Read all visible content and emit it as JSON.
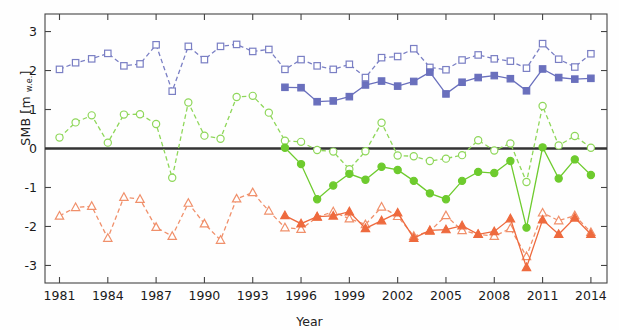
{
  "chart_data": {
    "type": "line",
    "title": "",
    "xlabel": "Year",
    "ylabel": "SMB [m w.e.]",
    "ylabel_base": "SMB [m ",
    "ylabel_sub": "w.e.",
    "ylabel_tail": "]",
    "xlim": [
      1980.1,
      2015.0
    ],
    "ylim": [
      -3.45,
      3.45
    ],
    "xticks": [
      1981,
      1984,
      1987,
      1990,
      1993,
      1996,
      1999,
      2002,
      2005,
      2008,
      2011,
      2014
    ],
    "xticklabels": [
      "1981",
      "1984",
      "1987",
      "1990",
      "1993",
      "1996",
      "1999",
      "2002",
      "2005",
      "2008",
      "2011",
      "2014"
    ],
    "yticks": [
      -3,
      -2,
      -1,
      0,
      1,
      2,
      3
    ],
    "yticklabels": [
      "-3",
      "-2",
      "-1",
      "0",
      "1",
      "2",
      "3"
    ],
    "grid": false,
    "zero_line": true,
    "zero_line_color": "#333333",
    "colors": {
      "blue": "#7a7fc4",
      "green": "#7ed84a",
      "orange": "#ef7a52",
      "axis": "#444444",
      "zero": "#333333"
    },
    "series": [
      {
        "name": "blue-open-dashed",
        "color": "#7a7fc4",
        "marker": "square",
        "fill": "open",
        "linestyle": "dashed",
        "x": [
          1981,
          1982,
          1983,
          1984,
          1985,
          1986,
          1987,
          1988,
          1989,
          1990,
          1991,
          1992,
          1993,
          1994,
          1995,
          1996,
          1997,
          1998,
          1999,
          2000,
          2001,
          2002,
          2003,
          2004,
          2005,
          2006,
          2007,
          2008,
          2009,
          2010,
          2011,
          2012,
          2013,
          2014
        ],
        "values": [
          2.03,
          2.2,
          2.3,
          2.44,
          2.12,
          2.17,
          2.66,
          1.47,
          2.62,
          2.28,
          2.62,
          2.67,
          2.49,
          2.54,
          2.03,
          2.28,
          2.12,
          2.03,
          2.16,
          1.82,
          2.33,
          2.36,
          2.56,
          2.08,
          2.02,
          2.27,
          2.4,
          2.3,
          2.24,
          2.06,
          2.69,
          2.29,
          2.09,
          2.43
        ]
      },
      {
        "name": "blue-filled-solid",
        "color": "#6a70bd",
        "marker": "square",
        "fill": "filled",
        "linestyle": "solid",
        "x": [
          1995,
          1996,
          1997,
          1998,
          1999,
          2000,
          2001,
          2002,
          2003,
          2004,
          2005,
          2006,
          2007,
          2008,
          2009,
          2010,
          2011,
          2012,
          2013,
          2014
        ],
        "values": [
          1.57,
          1.56,
          1.2,
          1.22,
          1.33,
          1.63,
          1.73,
          1.6,
          1.72,
          1.96,
          1.4,
          1.7,
          1.82,
          1.87,
          1.79,
          1.48,
          2.04,
          1.82,
          1.78,
          1.8
        ]
      },
      {
        "name": "green-open-dashed",
        "color": "#8fd75a",
        "marker": "circle",
        "fill": "open",
        "linestyle": "dashed",
        "x": [
          1981,
          1982,
          1983,
          1984,
          1985,
          1986,
          1987,
          1988,
          1989,
          1990,
          1991,
          1992,
          1993,
          1994,
          1995,
          1996,
          1997,
          1998,
          1999,
          2000,
          2001,
          2002,
          2003,
          2004,
          2005,
          2006,
          2007,
          2008,
          2009,
          2010,
          2011,
          2012,
          2013,
          2014
        ],
        "values": [
          0.28,
          0.67,
          0.85,
          0.15,
          0.87,
          0.88,
          0.63,
          -0.75,
          1.18,
          0.33,
          0.25,
          1.32,
          1.35,
          0.92,
          0.2,
          0.17,
          -0.04,
          -0.08,
          -0.53,
          -0.07,
          0.66,
          -0.18,
          -0.2,
          -0.32,
          -0.26,
          -0.17,
          0.21,
          -0.05,
          0.13,
          -0.86,
          1.09,
          0.08,
          0.32,
          0.02
        ]
      },
      {
        "name": "green-filled-solid",
        "color": "#6ecb2e",
        "marker": "circle",
        "fill": "filled",
        "linestyle": "solid",
        "x": [
          1995,
          1996,
          1997,
          1998,
          1999,
          2000,
          2001,
          2002,
          2003,
          2004,
          2005,
          2006,
          2007,
          2008,
          2009,
          2010,
          2011,
          2012,
          2013,
          2014
        ],
        "values": [
          0.02,
          -0.4,
          -1.3,
          -0.95,
          -0.65,
          -0.8,
          -0.47,
          -0.55,
          -0.83,
          -1.15,
          -1.3,
          -0.83,
          -0.6,
          -0.63,
          -0.32,
          -2.03,
          0.03,
          -0.77,
          -0.28,
          -0.68
        ]
      },
      {
        "name": "orange-open-dashed",
        "color": "#f0906b",
        "marker": "triangle",
        "fill": "open",
        "linestyle": "dashed",
        "x": [
          1981,
          1982,
          1983,
          1984,
          1985,
          1986,
          1987,
          1988,
          1989,
          1990,
          1991,
          1992,
          1993,
          1994,
          1995,
          1996,
          1997,
          1998,
          1999,
          2000,
          2001,
          2002,
          2003,
          2004,
          2005,
          2006,
          2007,
          2008,
          2009,
          2010,
          2011,
          2012,
          2013,
          2014
        ],
        "values": [
          -1.73,
          -1.51,
          -1.48,
          -2.3,
          -1.25,
          -1.3,
          -2.02,
          -2.25,
          -1.4,
          -1.93,
          -2.35,
          -1.29,
          -1.13,
          -1.6,
          -2.03,
          -2.07,
          -1.76,
          -1.62,
          -1.8,
          -1.95,
          -1.5,
          -1.74,
          -2.25,
          -2.12,
          -1.72,
          -2.1,
          -2.2,
          -2.25,
          -2.05,
          -2.77,
          -1.65,
          -1.85,
          -1.72,
          -2.15
        ]
      },
      {
        "name": "orange-filled-solid",
        "color": "#ee6a3e",
        "marker": "triangle",
        "fill": "filled",
        "linestyle": "solid",
        "x": [
          1995,
          1996,
          1997,
          1998,
          1999,
          2000,
          2001,
          2002,
          2003,
          2004,
          2005,
          2006,
          2007,
          2008,
          2009,
          2010,
          2011,
          2012,
          2013,
          2014
        ],
        "values": [
          -1.72,
          -1.93,
          -1.75,
          -1.73,
          -1.62,
          -2.05,
          -1.85,
          -1.65,
          -2.3,
          -2.1,
          -2.08,
          -1.98,
          -2.2,
          -2.13,
          -1.8,
          -3.05,
          -1.83,
          -2.2,
          -1.78,
          -2.2
        ]
      }
    ]
  }
}
